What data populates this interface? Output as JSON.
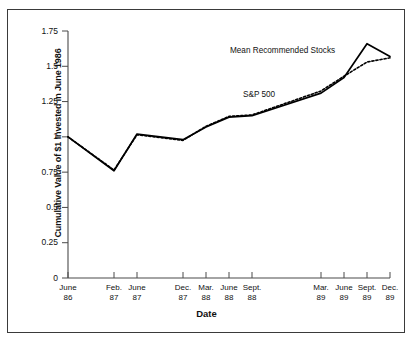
{
  "chart_data": {
    "type": "line",
    "title": "",
    "xlabel": "Date",
    "ylabel": "Cumulative Value of $1 Invested in June 1986",
    "categories": [
      "June 86",
      "Feb. 87",
      "June 87",
      "Dec. 87",
      "Mar. 88",
      "June 88",
      "Sept. 88",
      "Mar. 89",
      "June 89",
      "Sept. 89",
      "Dec. 89"
    ],
    "category_lines": [
      [
        "June",
        "86"
      ],
      [
        "Feb.",
        "87"
      ],
      [
        "June",
        "87"
      ],
      [
        "Dec.",
        "87"
      ],
      [
        "Mar.",
        "88"
      ],
      [
        "June",
        "88"
      ],
      [
        "Sept.",
        "88"
      ],
      [
        "Mar.",
        "89"
      ],
      [
        "June",
        "89"
      ],
      [
        "Sept.",
        "89"
      ],
      [
        "Dec.",
        "89"
      ]
    ],
    "category_positions": [
      0,
      2,
      3,
      5,
      6,
      7,
      8,
      11,
      12,
      13,
      14
    ],
    "ylim": [
      0,
      1.75
    ],
    "yticks": [
      0,
      0.25,
      0.5,
      0.75,
      1,
      1.25,
      1.5,
      1.75
    ],
    "ytick_labels": [
      "0",
      "0.25",
      "0.5",
      "0.75",
      "1",
      "1.25",
      "1.5",
      "1.75"
    ],
    "grid": false,
    "legend_position": "inline-annotation",
    "series": [
      {
        "name": "Mean Recommended Stocks",
        "style": "solid",
        "color": "#000000",
        "values": [
          1.0,
          0.76,
          1.02,
          0.98,
          1.07,
          1.14,
          1.15,
          1.31,
          1.42,
          1.66,
          1.57
        ]
      },
      {
        "name": "S&P 500",
        "style": "dotted",
        "color": "#000000",
        "values": [
          1.0,
          0.765,
          1.015,
          0.975,
          1.075,
          1.145,
          1.155,
          1.325,
          1.43,
          1.53,
          1.56
        ]
      }
    ],
    "annotations": [
      {
        "text": "Mean Recommended Stocks",
        "x_px": 230,
        "y_px": 46
      },
      {
        "text": "S&P 500",
        "x_px": 243,
        "y_px": 90
      }
    ]
  },
  "axes": {
    "x_title": "Date",
    "y_title": "Cumulative Value of $1 Invested in June 1986"
  },
  "colors": {
    "frame": "#3a3a3a",
    "axis": "#4a4a4a",
    "ink": "#111111",
    "series": "#000000",
    "background": "#ffffff"
  }
}
